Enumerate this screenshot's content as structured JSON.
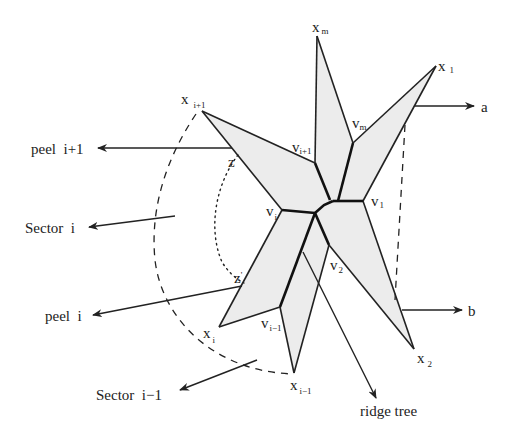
{
  "diagram": {
    "vertices": {
      "x_m": {
        "base": "x",
        "sub": "m"
      },
      "x_1": {
        "base": "x",
        "sub": "1"
      },
      "x_i_plus_1": {
        "base": "x",
        "sub": "i+1"
      },
      "x_i": {
        "base": "x",
        "sub": "i"
      },
      "x_i_minus_1": {
        "base": "x",
        "sub": "i−1"
      },
      "x_2": {
        "base": "x",
        "sub": "2"
      },
      "v_m": {
        "base": "v",
        "sub": "m"
      },
      "v_i_plus_1": {
        "base": "v",
        "sub": "i+1"
      },
      "v_1": {
        "base": "v",
        "sub": "1"
      },
      "v_i": {
        "base": "v",
        "sub": "i"
      },
      "v_2": {
        "base": "v",
        "sub": "2"
      },
      "v_i_minus_1": {
        "base": "v",
        "sub": "i−1"
      },
      "z": {
        "base": "z",
        "sub": "'"
      },
      "z_prime": {
        "base": "z",
        "sub": "'"
      }
    },
    "annotations": {
      "a": "a",
      "b": "b",
      "peel_i_plus_1": "peel  i+1",
      "sector_i": "Sector  i",
      "peel_i": "peel  i",
      "sector_i_minus_1": "Sector  i−1",
      "ridge_tree": "ridge tree"
    }
  }
}
